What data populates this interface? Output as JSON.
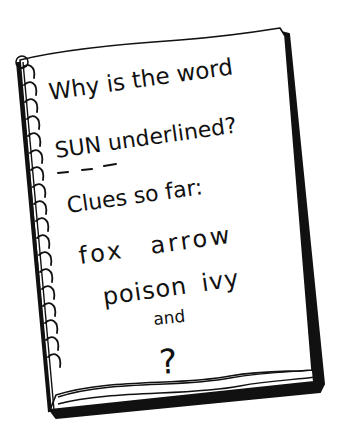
{
  "illustration": {
    "subject": "spiral-notebook",
    "notebook_lines": [
      {
        "text": "Why is the word"
      },
      {
        "text": "SUN underlined?"
      },
      {
        "text": "Clues so far:"
      },
      {
        "text": "fox arrow"
      },
      {
        "text": "poison ivy"
      },
      {
        "text": "and"
      },
      {
        "text": "?"
      }
    ],
    "underlined_word": "SUN",
    "underline_style": "dashed",
    "clues": [
      "fox",
      "arrow",
      "poison ivy"
    ],
    "colors": {
      "ink": "#111111",
      "page": "#ffffff",
      "background": "#ffffff"
    }
  }
}
